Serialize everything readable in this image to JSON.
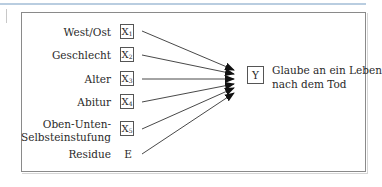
{
  "diagram": {
    "predictors": [
      {
        "label": "West/Ost",
        "var": "X",
        "sub": "1"
      },
      {
        "label": "Geschlecht",
        "var": "X",
        "sub": "2"
      },
      {
        "label": "Alter",
        "var": "X",
        "sub": "3"
      },
      {
        "label": "Abitur",
        "var": "X",
        "sub": "4"
      },
      {
        "label_line1": "Oben-Unten-",
        "label_line2": "Selbsteinstufung",
        "var": "X",
        "sub": "5"
      }
    ],
    "residual": {
      "label": "Residue",
      "var": "E"
    },
    "outcome": {
      "var": "Y",
      "label_line1": "Glaube an ein Leben",
      "label_line2": "nach dem Tod"
    }
  }
}
